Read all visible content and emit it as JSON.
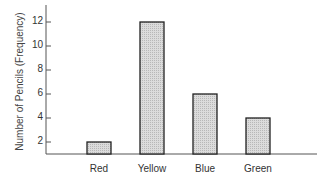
{
  "chart_data": {
    "type": "bar",
    "title": "",
    "xlabel": "",
    "ylabel": "Number of Pencils (Frequency)",
    "categories": [
      "Red",
      "Yellow",
      "Blue",
      "Green"
    ],
    "values": [
      2,
      12,
      6,
      4
    ],
    "yticks": [
      2,
      4,
      6,
      8,
      10,
      12
    ],
    "ylim": [
      1,
      13.5
    ],
    "grid": false,
    "legend": null,
    "bar_fill": "hatched-gray",
    "colors": {
      "bar_fill": "#d2d2d2",
      "bar_stroke": "#222222",
      "axis": "#555555"
    }
  }
}
